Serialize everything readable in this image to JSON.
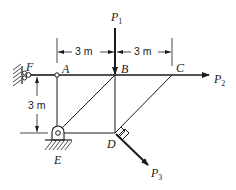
{
  "diagram": {
    "type": "truss",
    "nodes": [
      {
        "id": "F",
        "label": "F",
        "support": "roller-wall"
      },
      {
        "id": "A",
        "label": "A",
        "support": "pin-joint"
      },
      {
        "id": "B",
        "label": "B"
      },
      {
        "id": "C",
        "label": "C"
      },
      {
        "id": "D",
        "label": "D"
      },
      {
        "id": "E",
        "label": "E",
        "support": "pin-ground"
      }
    ],
    "members": [
      [
        "F",
        "A"
      ],
      [
        "A",
        "B"
      ],
      [
        "B",
        "C"
      ],
      [
        "A",
        "E"
      ],
      [
        "E",
        "B"
      ],
      [
        "B",
        "D"
      ],
      [
        "E",
        "D"
      ],
      [
        "D",
        "C"
      ]
    ],
    "loads": [
      {
        "id": "P1",
        "label": "P",
        "sub": "1",
        "at": "B",
        "direction": "down"
      },
      {
        "id": "P2",
        "label": "P",
        "sub": "2",
        "at": "C",
        "direction": "right"
      },
      {
        "id": "P3",
        "label": "P",
        "sub": "3",
        "at": "D",
        "direction": "perpendicular to DC, down-right"
      }
    ],
    "dimensions": [
      {
        "id": "dim-AB",
        "text": "3 m",
        "from": "A",
        "to": "B"
      },
      {
        "id": "dim-BC",
        "text": "3 m",
        "from": "B",
        "to": "C"
      },
      {
        "id": "dim-vertical",
        "text": "3 m",
        "from": "F-level",
        "to": "E-level"
      }
    ],
    "annotations": {
      "right_angle_at": "D"
    },
    "colors": {
      "line": "#1a1a1a",
      "background": "#ffffff"
    }
  }
}
